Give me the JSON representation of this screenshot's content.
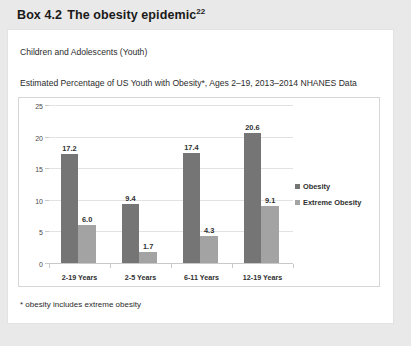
{
  "box": {
    "label": "Box 4.2",
    "title": "The obesity epidemic",
    "reference_superscript": "22"
  },
  "card": {
    "heading": "Children and Adolescents (Youth)",
    "subheading": "Estimated Percentage of US Youth with Obesity*, Ages 2–19, 2013–2014 NHANES Data",
    "footnote": "* obesity includes extreme obesity"
  },
  "chart_data": {
    "type": "bar",
    "title": "",
    "xlabel": "",
    "ylabel": "",
    "ylim": [
      0,
      25
    ],
    "yticks": [
      0,
      5,
      10,
      15,
      20,
      25
    ],
    "grid": true,
    "legend_position": "right",
    "categories": [
      "2-19 Years",
      "2-5 Years",
      "6-11 Years",
      "12-19 Years"
    ],
    "series": [
      {
        "name": "Obesity",
        "color": "#757575",
        "values": [
          17.2,
          9.4,
          17.4,
          20.6
        ],
        "labels": [
          "17.2",
          "9.4",
          "17.4",
          "20.6"
        ]
      },
      {
        "name": "Extreme Obesity",
        "color": "#a3a3a3",
        "values": [
          6.0,
          1.7,
          4.3,
          9.1
        ],
        "labels": [
          "6.0",
          "1.7",
          "4.3",
          "9.1"
        ]
      }
    ]
  },
  "colors": {
    "page_background": "#e9e9e9",
    "card_background": "#ffffff",
    "obesity": "#757575",
    "extreme_obesity": "#a3a3a3",
    "gridline": "#e2e2e2"
  }
}
